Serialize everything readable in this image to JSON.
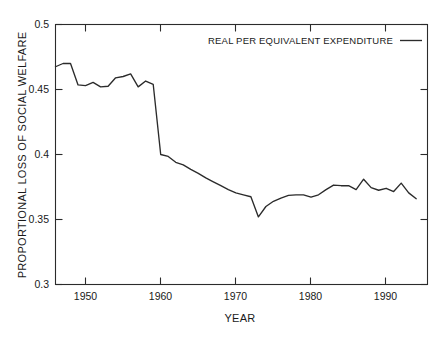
{
  "chart_data": {
    "type": "line",
    "title": "",
    "xlabel": "YEAR",
    "ylabel": "PROPORTIONAL LOSS OF SOCIAL WELFARE",
    "xlim": [
      1946,
      1995.5
    ],
    "ylim": [
      0.3,
      0.5
    ],
    "grid": false,
    "legend_position": "top-right",
    "xticks": [
      1950,
      1960,
      1970,
      1980,
      1990
    ],
    "xtick_labels": [
      "1950",
      "1960",
      "1970",
      "1980",
      "1990"
    ],
    "yticks": [
      0.3,
      0.35,
      0.4,
      0.45,
      0.5
    ],
    "ytick_labels": [
      "0.3",
      "0.35",
      "0.4",
      "0.45",
      "0.5"
    ],
    "series": [
      {
        "name": "REAL PER EQUIVALENT EXPENDITURE",
        "color": "#2b2b2b",
        "x": [
          1946,
          1947,
          1948,
          1949,
          1950,
          1951,
          1952,
          1953,
          1954,
          1955,
          1956,
          1957,
          1958,
          1959,
          1960,
          1961,
          1962,
          1963,
          1964,
          1965,
          1966,
          1967,
          1968,
          1969,
          1970,
          1971,
          1972,
          1973,
          1974,
          1975,
          1976,
          1977,
          1978,
          1979,
          1980,
          1981,
          1982,
          1983,
          1984,
          1985,
          1986,
          1987,
          1988,
          1989,
          1990,
          1991,
          1992,
          1993,
          1994
        ],
        "values": [
          0.4675,
          0.47,
          0.47,
          0.4535,
          0.453,
          0.4555,
          0.452,
          0.4525,
          0.459,
          0.46,
          0.462,
          0.452,
          0.4565,
          0.454,
          0.4,
          0.3985,
          0.394,
          0.392,
          0.3885,
          0.3855,
          0.382,
          0.379,
          0.376,
          0.373,
          0.3705,
          0.369,
          0.3675,
          0.352,
          0.36,
          0.364,
          0.3665,
          0.3685,
          0.369,
          0.369,
          0.3672,
          0.369,
          0.373,
          0.3765,
          0.376,
          0.376,
          0.373,
          0.381,
          0.3745,
          0.3725,
          0.374,
          0.3715,
          0.378,
          0.3705,
          0.366
        ]
      }
    ]
  },
  "legend": {
    "entries": [
      {
        "label": "REAL PER EQUIVALENT EXPENDITURE"
      }
    ]
  },
  "axes": {
    "x_title": "YEAR",
    "y_title": "PROPORTIONAL LOSS OF SOCIAL WELFARE"
  }
}
